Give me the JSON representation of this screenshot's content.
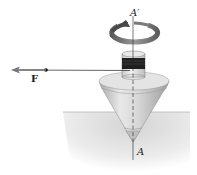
{
  "figure": {
    "labels": {
      "axis_top": "A′",
      "axis_bottom": "A",
      "force": "F"
    },
    "colors": {
      "ground": "#d9d9d9",
      "cone": "#c8c8c8",
      "spool_band": "#1e1e1e",
      "rotation_arrow": "#6e6e6e",
      "line": "#222222"
    }
  }
}
